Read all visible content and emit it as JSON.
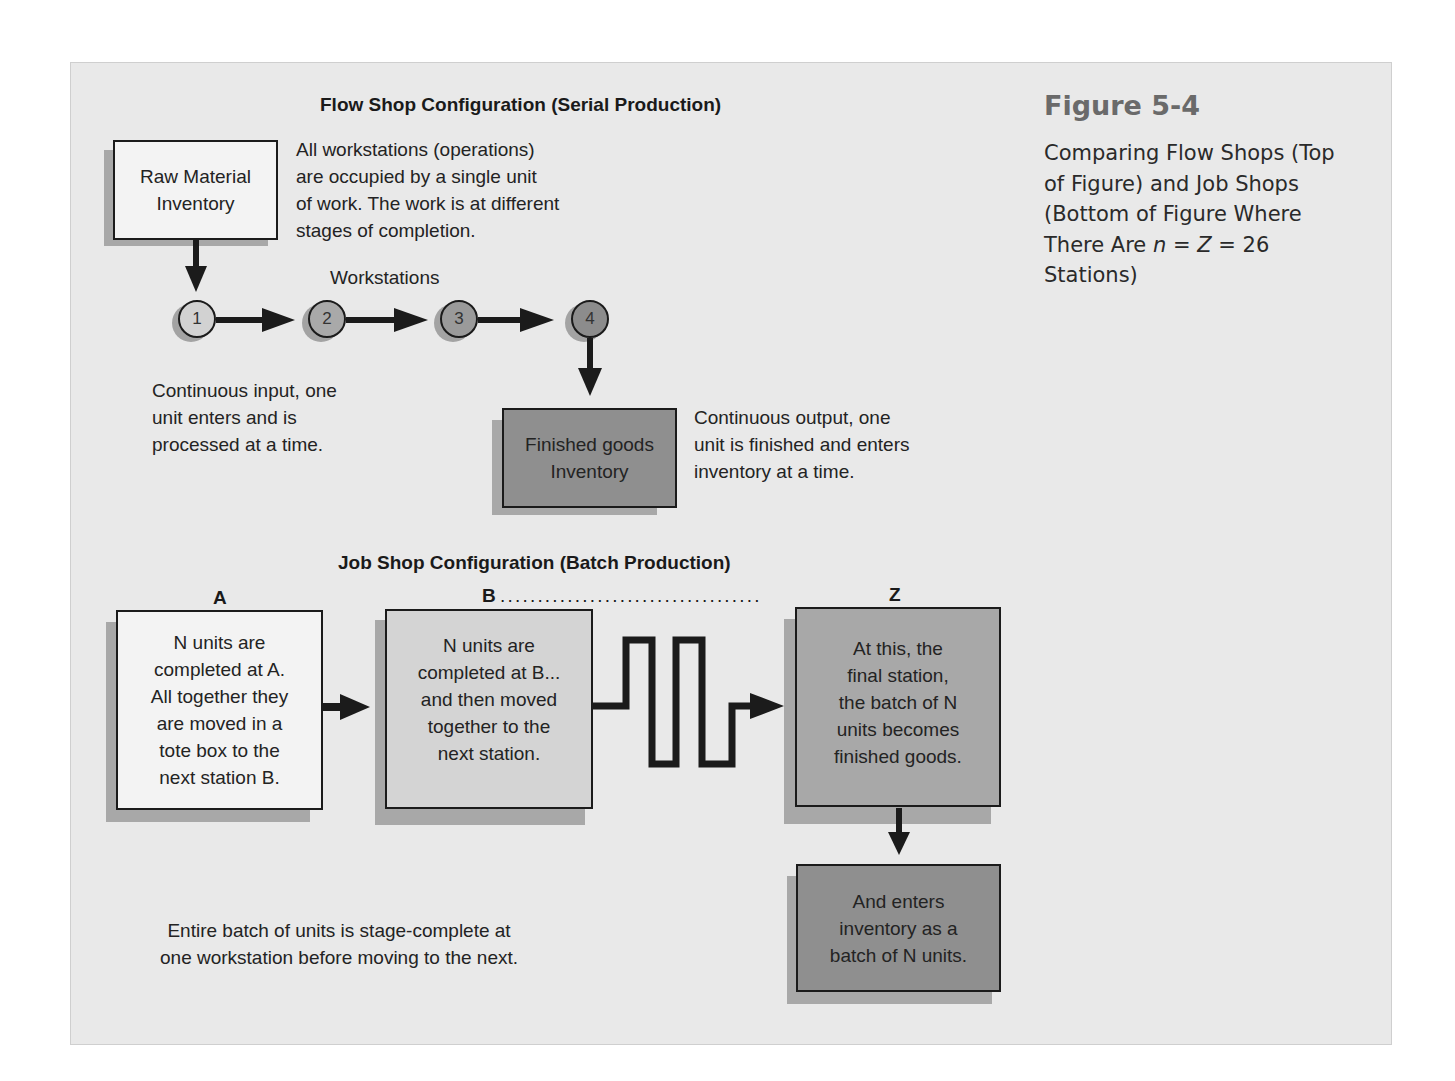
{
  "figure": {
    "number": "Figure 5-4",
    "caption_line1": "Comparing Flow Shops (Top",
    "caption_line2": "of Figure) and Job Shops",
    "caption_line3": "(Bottom of Figure Where",
    "caption_line4_prefix": "There Are ",
    "caption_line4_var1": "n",
    "caption_line4_eq1": " = ",
    "caption_line4_var2": "Z",
    "caption_line4_eq2": " = 26",
    "caption_line5": "Stations)"
  },
  "flow_shop": {
    "title": "Flow Shop Configuration (Serial Production)",
    "raw_material_box": "Raw Material\nInventory",
    "description": "All workstations (operations)\nare occupied by a single unit\nof work. The work is at different\nstages of completion.",
    "workstations_label": "Workstations",
    "stations": [
      {
        "label": "1",
        "color": "#d2d2d2"
      },
      {
        "label": "2",
        "color": "#a9a9a9"
      },
      {
        "label": "3",
        "color": "#9a9a9a"
      },
      {
        "label": "4",
        "color": "#8c8c8c"
      }
    ],
    "input_note": "Continuous input, one\nunit enters and is\nprocessed at a time.",
    "finished_box": "Finished goods\nInventory",
    "output_note": "Continuous output, one\nunit is finished and enters\ninventory at a time."
  },
  "job_shop": {
    "title": "Job Shop Configuration (Batch Production)",
    "label_a": "A",
    "label_b": "B",
    "label_dots": "...................................",
    "label_z": "Z",
    "box_a": "N units are\ncompleted at A.\nAll together they\nare moved in a\ntote box to the\nnext station B.",
    "box_b": "N units are\ncompleted at B...\nand then moved\ntogether to the\nnext station.",
    "box_z": "At this, the\nfinal station,\nthe batch of N\nunits becomes\nfinished goods.",
    "box_inventory": "And enters\ninventory as a\nbatch of N units.",
    "bottom_note": "Entire batch of units is stage-complete at\none workstation before moving to the next."
  },
  "colors": {
    "panel_bg": "#e9e9e9",
    "box_white": "#f3f3f3",
    "box_light": "#d4d4d4",
    "box_mid": "#a8a8a8",
    "box_dark": "#8f8f8f",
    "shadow": "#a8a8a8",
    "line": "#1b1b1b"
  }
}
